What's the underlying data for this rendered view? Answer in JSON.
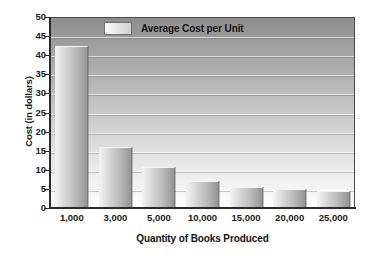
{
  "chart_data": {
    "type": "bar",
    "title": "",
    "categories": [
      "1,000",
      "3,000",
      "5,000",
      "10,000",
      "15,000",
      "20,000",
      "25,000"
    ],
    "values": [
      42.5,
      16,
      10.8,
      7,
      5.5,
      5,
      4.5
    ],
    "series": [
      {
        "name": "Average Cost per Unit",
        "values": [
          42.5,
          16,
          10.8,
          7,
          5.5,
          5,
          4.5
        ]
      }
    ],
    "xlabel": "Quantity of Books Produced",
    "ylabel": "Cost (in dollars)",
    "ylim": [
      0,
      50
    ],
    "yticks": [
      0,
      5,
      10,
      15,
      20,
      25,
      30,
      35,
      40,
      45,
      50
    ],
    "ytick_labels": [
      "0",
      "5",
      "10",
      "15",
      "20",
      "25",
      "30",
      "35",
      "40",
      "45",
      "50"
    ],
    "grid": true,
    "legend": {
      "position": "top-left-inside",
      "entries": [
        "Average Cost per Unit"
      ]
    },
    "colors": {
      "bar_light": "#f2f2f2",
      "bar_dark": "#959595",
      "plot_bg_top": "#8e8e8e",
      "plot_bg_bottom": "#fdfdfd",
      "axis": "#2b2b2b",
      "text": "#141414"
    }
  }
}
